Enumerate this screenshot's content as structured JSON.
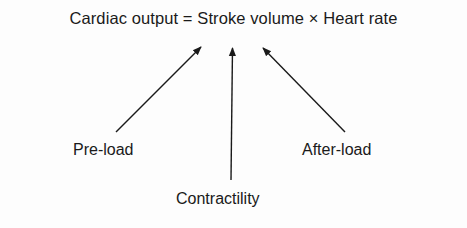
{
  "diagram": {
    "equation": {
      "lhs": "Cardiac output",
      "equals": "=",
      "term1": "Stroke volume",
      "times": "×",
      "term2": "Heart rate",
      "full_text": "Cardiac output = Stroke volume × Heart rate"
    },
    "factors": [
      {
        "id": "preload",
        "label": "Pre-load",
        "target": "Stroke volume"
      },
      {
        "id": "contractility",
        "label": "Contractility",
        "target": "Stroke volume"
      },
      {
        "id": "afterload",
        "label": "After-load",
        "target": "Stroke volume"
      }
    ],
    "colors": {
      "ink": "#1a1a1a",
      "background": "#fdfdfd"
    }
  }
}
